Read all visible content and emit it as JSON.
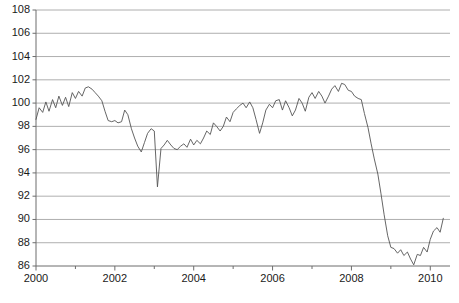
{
  "chart_data": {
    "type": "line",
    "title": "",
    "subtitle": "",
    "xlabel": "",
    "ylabel": "",
    "xlim": [
      2000.0,
      2010.5
    ],
    "ylim": [
      86,
      108
    ],
    "ytick_step": 2,
    "yticks": [
      86,
      88,
      90,
      92,
      94,
      96,
      98,
      100,
      102,
      104,
      106,
      108
    ],
    "ytick_labels": [
      "86",
      "88",
      "90",
      "92",
      "94",
      "96",
      "98",
      "100",
      "102",
      "104",
      "106",
      "108"
    ],
    "xticks": [
      2000,
      2001,
      2002,
      2003,
      2004,
      2005,
      2006,
      2007,
      2008,
      2009,
      2010
    ],
    "xtick_labels_major": [
      "2000",
      "2002",
      "2004",
      "2006",
      "2008",
      "2010"
    ],
    "xticks_major": [
      2000,
      2002,
      2004,
      2006,
      2008,
      2010
    ],
    "grid": true,
    "grid_axis": "y",
    "grid_color": "#9a9a9a",
    "line_color": "#555555",
    "line_width": 0.9,
    "legend": false,
    "legend_position": "none",
    "annotations": [],
    "series": [
      {
        "name": "index",
        "x": [
          2000.0,
          2000.08,
          2000.17,
          2000.25,
          2000.33,
          2000.42,
          2000.5,
          2000.58,
          2000.67,
          2000.75,
          2000.83,
          2000.92,
          2001.0,
          2001.08,
          2001.17,
          2001.25,
          2001.33,
          2001.42,
          2001.5,
          2001.58,
          2001.67,
          2001.75,
          2001.83,
          2001.92,
          2002.0,
          2002.08,
          2002.17,
          2002.25,
          2002.33,
          2002.42,
          2002.5,
          2002.58,
          2002.67,
          2002.75,
          2002.83,
          2002.92,
          2003.0,
          2003.08,
          2003.17,
          2003.25,
          2003.33,
          2003.42,
          2003.5,
          2003.58,
          2003.67,
          2003.75,
          2003.83,
          2003.92,
          2004.0,
          2004.08,
          2004.17,
          2004.25,
          2004.33,
          2004.42,
          2004.5,
          2004.58,
          2004.67,
          2004.75,
          2004.83,
          2004.92,
          2005.0,
          2005.08,
          2005.17,
          2005.25,
          2005.33,
          2005.42,
          2005.5,
          2005.58,
          2005.67,
          2005.75,
          2005.83,
          2005.92,
          2006.0,
          2006.08,
          2006.17,
          2006.25,
          2006.33,
          2006.42,
          2006.5,
          2006.58,
          2006.67,
          2006.75,
          2006.83,
          2006.92,
          2007.0,
          2007.08,
          2007.17,
          2007.25,
          2007.33,
          2007.42,
          2007.5,
          2007.58,
          2007.67,
          2007.75,
          2007.83,
          2007.92,
          2008.0,
          2008.08,
          2008.17,
          2008.25,
          2008.33,
          2008.42,
          2008.5,
          2008.58,
          2008.67,
          2008.75,
          2008.83,
          2008.92,
          2009.0,
          2009.08,
          2009.17,
          2009.25,
          2009.33,
          2009.42,
          2009.5,
          2009.58,
          2009.67,
          2009.75,
          2009.83,
          2009.92,
          2010.0,
          2010.08,
          2010.17,
          2010.25,
          2010.33
        ],
        "values": [
          98.6,
          99.6,
          99.2,
          100.1,
          99.3,
          100.3,
          99.6,
          100.6,
          99.8,
          100.5,
          99.7,
          100.9,
          100.4,
          101.0,
          100.6,
          101.3,
          101.4,
          101.2,
          100.9,
          100.6,
          100.2,
          99.3,
          98.5,
          98.4,
          98.5,
          98.3,
          98.4,
          99.4,
          99.0,
          97.8,
          97.0,
          96.3,
          95.8,
          96.6,
          97.4,
          97.8,
          97.6,
          92.8,
          96.1,
          96.4,
          96.8,
          96.4,
          96.1,
          96.0,
          96.3,
          96.5,
          96.2,
          96.9,
          96.4,
          96.8,
          96.5,
          97.0,
          97.6,
          97.3,
          98.3,
          98.0,
          97.6,
          98.0,
          98.8,
          98.4,
          99.2,
          99.5,
          99.8,
          100.0,
          99.6,
          100.1,
          99.6,
          98.6,
          97.4,
          98.3,
          99.4,
          99.9,
          99.6,
          100.2,
          100.3,
          99.4,
          100.2,
          99.6,
          98.9,
          99.4,
          100.4,
          100.0,
          99.3,
          100.5,
          100.9,
          100.4,
          101.0,
          100.6,
          100.0,
          100.6,
          101.2,
          101.5,
          101.0,
          101.7,
          101.6,
          101.1,
          101.0,
          100.6,
          100.4,
          100.3,
          99.1,
          97.9,
          96.5,
          95.2,
          93.9,
          92.2,
          90.4,
          88.6,
          87.6,
          87.5,
          87.1,
          87.4,
          86.9,
          87.2,
          86.6,
          86.1,
          87.0,
          86.9,
          87.6,
          87.2,
          88.3,
          89.0,
          89.3,
          88.9,
          90.1
        ]
      }
    ]
  },
  "axes": {
    "y_axis_name": "value-axis",
    "x_axis_name": "time-axis"
  }
}
